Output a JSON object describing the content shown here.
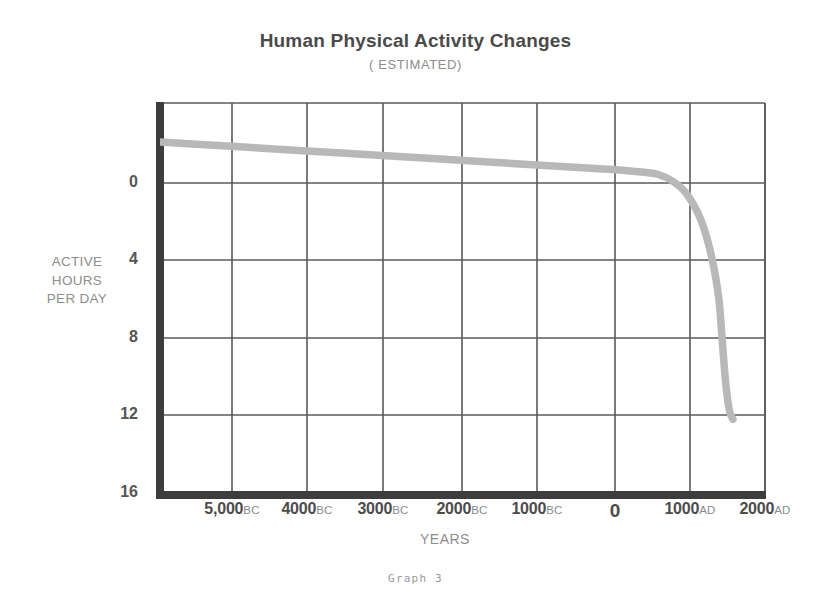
{
  "header": {
    "title": "Human Physical Activity Changes",
    "subtitle": "( ESTIMATED)"
  },
  "caption": "Graph  3",
  "colors": {
    "title": "#4a4a4a",
    "subtitle": "#8d8d8d",
    "axis": "#4c4c4c",
    "grid": "#5a5a5a",
    "curve": "#b8b8b8",
    "label_gray": "#8d8d8d",
    "background": "#ffffff"
  },
  "chart_data": {
    "type": "line",
    "title": "Human Physical Activity Changes",
    "subtitle": "( ESTIMATED)",
    "xlabel": "YEARS",
    "ylabel": "ACTIVE HOURS PER DAY",
    "ylabel_lines": [
      "ACTIVE",
      "HOURS",
      "PER DAY"
    ],
    "grid": true,
    "legend": "none",
    "xlim": [
      -6000,
      2500
    ],
    "ylim": [
      0,
      18
    ],
    "yticks": [
      0,
      4,
      8,
      12,
      16
    ],
    "ytick_labels": [
      "0",
      "4",
      "8",
      "12",
      "16"
    ],
    "xticks": [
      -5000,
      -4000,
      -3000,
      -2000,
      -1000,
      0,
      1000,
      2000
    ],
    "xtick_labels": [
      {
        "num": "5,000",
        "era": "BC"
      },
      {
        "num": "4000",
        "era": "BC"
      },
      {
        "num": "3000",
        "era": "BC"
      },
      {
        "num": "2000",
        "era": "BC"
      },
      {
        "num": "1000",
        "era": "BC"
      },
      {
        "num": "0",
        "era": ""
      },
      {
        "num": "1000",
        "era": "AD"
      },
      {
        "num": "2000",
        "era": "AD"
      }
    ],
    "series": [
      {
        "name": "Active hours per day",
        "x": [
          -6000,
          -5000,
          -4000,
          -3000,
          -2000,
          -1000,
          0,
          500,
          800,
          1000,
          1200,
          1400,
          1600,
          1750,
          1850,
          1900,
          1950,
          2000,
          2050
        ],
        "values": [
          16.2,
          16.0,
          15.8,
          15.6,
          15.4,
          15.2,
          15.0,
          14.9,
          14.8,
          14.7,
          14.4,
          13.8,
          12.6,
          10.9,
          9.0,
          7.0,
          5.0,
          3.8,
          3.4
        ]
      }
    ],
    "annotations": [
      "Graph  3"
    ]
  },
  "axes_geometry": {
    "note": "pixel mapping used by template",
    "plot_left": 10,
    "plot_right": 615,
    "plot_top": 5,
    "plot_bottom": 395,
    "gridlines_x": [
      10,
      82,
      157,
      233,
      312,
      387,
      465,
      540,
      615
    ],
    "gridlines_y": [
      5,
      85,
      162,
      240,
      317,
      395
    ],
    "ytick_y": [
      85,
      162,
      240,
      317,
      395
    ],
    "xtick_x": [
      82,
      157,
      233,
      312,
      387,
      465,
      540,
      615
    ]
  }
}
